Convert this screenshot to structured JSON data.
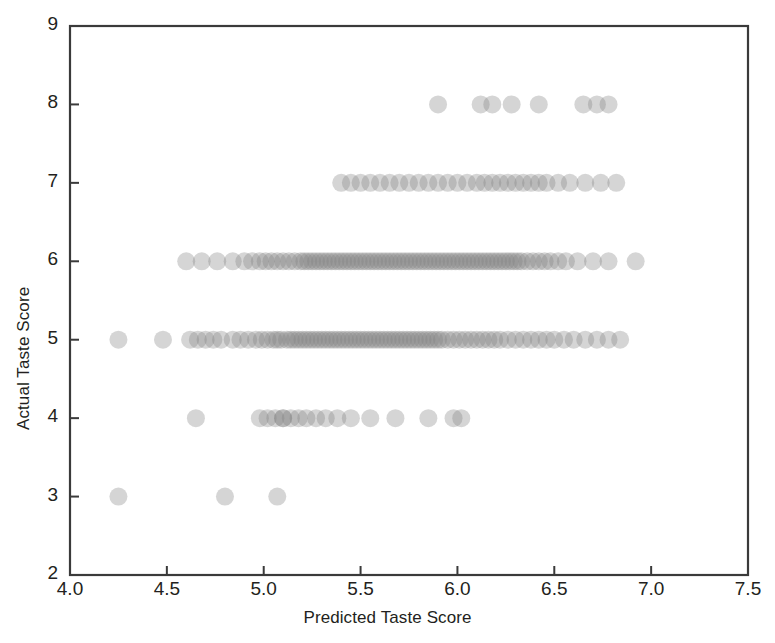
{
  "chart_data": {
    "type": "scatter",
    "title": "",
    "xlabel": "Predicted Taste Score",
    "ylabel": "Actual Taste Score",
    "xlim": [
      4.0,
      7.5
    ],
    "ylim": [
      2,
      9
    ],
    "xticks": [
      "4.0",
      "4.5",
      "5.0",
      "5.5",
      "6.0",
      "6.5",
      "7.0",
      "7.5"
    ],
    "xtick_values": [
      4.0,
      4.5,
      5.0,
      5.5,
      6.0,
      6.5,
      7.0,
      7.5
    ],
    "yticks": [
      "2",
      "3",
      "4",
      "5",
      "6",
      "7",
      "8",
      "9"
    ],
    "ytick_values": [
      2,
      3,
      4,
      5,
      6,
      7,
      8,
      9
    ],
    "grid": false,
    "legend": null,
    "marker": {
      "shape": "circle",
      "color": "#808080",
      "opacity": 0.33,
      "size_px": 18
    },
    "series": [
      {
        "name": "Predicted vs Actual Taste Score",
        "x": [
          4.25,
          4.8,
          5.07,
          4.65,
          4.98,
          5.02,
          5.06,
          5.1,
          5.1,
          5.14,
          5.18,
          5.22,
          5.27,
          5.32,
          5.38,
          5.45,
          5.55,
          5.68,
          5.85,
          5.98,
          6.02,
          4.25,
          4.48,
          4.62,
          4.66,
          4.7,
          4.74,
          4.78,
          4.84,
          4.88,
          4.92,
          4.96,
          4.99,
          5.02,
          5.05,
          5.07,
          5.09,
          5.12,
          5.14,
          5.16,
          5.18,
          5.2,
          5.22,
          5.24,
          5.26,
          5.28,
          5.3,
          5.32,
          5.34,
          5.36,
          5.38,
          5.4,
          5.42,
          5.44,
          5.46,
          5.48,
          5.5,
          5.52,
          5.54,
          5.56,
          5.58,
          5.6,
          5.62,
          5.64,
          5.66,
          5.68,
          5.7,
          5.72,
          5.74,
          5.76,
          5.78,
          5.8,
          5.82,
          5.84,
          5.86,
          5.88,
          5.9,
          5.92,
          5.95,
          5.98,
          6.01,
          6.04,
          6.07,
          6.1,
          6.13,
          6.16,
          6.19,
          6.22,
          6.26,
          6.3,
          6.34,
          6.38,
          6.42,
          6.46,
          6.5,
          6.55,
          6.6,
          6.66,
          6.72,
          6.78,
          6.84,
          4.6,
          4.68,
          4.76,
          4.84,
          4.9,
          4.94,
          4.98,
          5.01,
          5.04,
          5.07,
          5.1,
          5.13,
          5.16,
          5.19,
          5.21,
          5.23,
          5.25,
          5.27,
          5.29,
          5.31,
          5.33,
          5.35,
          5.37,
          5.39,
          5.41,
          5.43,
          5.45,
          5.47,
          5.49,
          5.51,
          5.53,
          5.55,
          5.57,
          5.59,
          5.61,
          5.63,
          5.65,
          5.67,
          5.69,
          5.71,
          5.73,
          5.75,
          5.77,
          5.79,
          5.81,
          5.83,
          5.85,
          5.87,
          5.89,
          5.91,
          5.93,
          5.95,
          5.97,
          5.99,
          6.01,
          6.03,
          6.05,
          6.07,
          6.09,
          6.11,
          6.13,
          6.15,
          6.17,
          6.19,
          6.21,
          6.23,
          6.25,
          6.27,
          6.29,
          6.31,
          6.33,
          6.36,
          6.39,
          6.42,
          6.45,
          6.48,
          6.52,
          6.56,
          6.62,
          6.7,
          6.78,
          6.92,
          5.4,
          5.45,
          5.5,
          5.55,
          5.6,
          5.65,
          5.7,
          5.75,
          5.8,
          5.85,
          5.9,
          5.95,
          6.0,
          6.05,
          6.1,
          6.14,
          6.18,
          6.22,
          6.26,
          6.3,
          6.34,
          6.38,
          6.42,
          6.46,
          6.52,
          6.58,
          6.66,
          6.74,
          6.82,
          5.9,
          6.12,
          6.18,
          6.28,
          6.42,
          6.65,
          6.72,
          6.78
        ],
        "y": [
          3,
          3,
          3,
          4,
          4,
          4,
          4,
          4,
          4,
          4,
          4,
          4,
          4,
          4,
          4,
          4,
          4,
          4,
          4,
          4,
          4,
          5,
          5,
          5,
          5,
          5,
          5,
          5,
          5,
          5,
          5,
          5,
          5,
          5,
          5,
          5,
          5,
          5,
          5,
          5,
          5,
          5,
          5,
          5,
          5,
          5,
          5,
          5,
          5,
          5,
          5,
          5,
          5,
          5,
          5,
          5,
          5,
          5,
          5,
          5,
          5,
          5,
          5,
          5,
          5,
          5,
          5,
          5,
          5,
          5,
          5,
          5,
          5,
          5,
          5,
          5,
          5,
          5,
          5,
          5,
          5,
          5,
          5,
          5,
          5,
          5,
          5,
          5,
          5,
          5,
          5,
          5,
          5,
          5,
          5,
          5,
          5,
          5,
          5,
          5,
          5,
          6,
          6,
          6,
          6,
          6,
          6,
          6,
          6,
          6,
          6,
          6,
          6,
          6,
          6,
          6,
          6,
          6,
          6,
          6,
          6,
          6,
          6,
          6,
          6,
          6,
          6,
          6,
          6,
          6,
          6,
          6,
          6,
          6,
          6,
          6,
          6,
          6,
          6,
          6,
          6,
          6,
          6,
          6,
          6,
          6,
          6,
          6,
          6,
          6,
          6,
          6,
          6,
          6,
          6,
          6,
          6,
          6,
          6,
          6,
          6,
          6,
          6,
          6,
          6,
          6,
          6,
          6,
          6,
          6,
          6,
          6,
          6,
          6,
          6,
          6,
          6,
          6,
          6,
          6,
          6,
          6,
          6,
          7,
          7,
          7,
          7,
          7,
          7,
          7,
          7,
          7,
          7,
          7,
          7,
          7,
          7,
          7,
          7,
          7,
          7,
          7,
          7,
          7,
          7,
          7,
          7,
          7,
          7,
          7,
          7,
          7,
          8,
          8,
          8,
          8,
          8,
          8,
          8,
          8
        ]
      }
    ]
  },
  "axes": {
    "x_title": "Predicted Taste Score",
    "y_title": "Actual Taste Score"
  }
}
